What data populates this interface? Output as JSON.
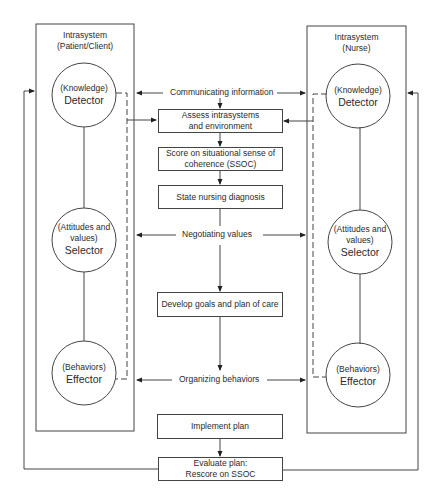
{
  "left_system": {
    "title_line1": "Intrasystem",
    "title_line2": "(Patient/Client)",
    "detector": {
      "sub": "(Knowledge)",
      "name": "Detector"
    },
    "selector": {
      "sub_line1": "(Attitudes and",
      "sub_line2": "values)",
      "name": "Selector"
    },
    "effector": {
      "sub": "(Behaviors)",
      "name": "Effector"
    }
  },
  "right_system": {
    "title_line1": "Intrasystem",
    "title_line2": "(Nurse)",
    "detector": {
      "sub": "(Knowledge)",
      "name": "Detector"
    },
    "selector": {
      "sub_line1": "(Attitudes and",
      "sub_line2": "values)",
      "name": "Selector"
    },
    "effector": {
      "sub": "(Behaviors)",
      "name": "Effector"
    }
  },
  "interactions": {
    "communicating": "Communicating information",
    "negotiating": "Negotiating values",
    "organizing": "Organizing behaviors"
  },
  "process": {
    "assess_line1": "Assess intrasystems",
    "assess_line2": "and environment",
    "score_line1": "Score on situational sense of",
    "score_line2": "coherence (SSOC)",
    "state": "State nursing diagnosis",
    "develop": "Develop goals and plan of care",
    "implement": "Implement plan",
    "evaluate_line1": "Evaluate plan:",
    "evaluate_line2": "Rescore on SSOC"
  },
  "colors": {
    "line": "#444444",
    "text": "#2a2a2a",
    "background": "#ffffff"
  }
}
